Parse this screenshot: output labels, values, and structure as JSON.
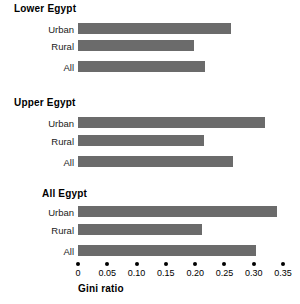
{
  "chart_data": {
    "type": "bar",
    "orientation": "horizontal",
    "title": "",
    "xlabel": "Gini ratio",
    "ylabel": "",
    "xlim": [
      0,
      0.35
    ],
    "grid": false,
    "legend": "none",
    "bar_color": "#6b6b6b",
    "categories": [
      "Urban",
      "Rural",
      "All"
    ],
    "xticks": [
      0,
      0.05,
      0.1,
      0.15,
      0.2,
      0.25,
      0.3,
      0.35
    ],
    "xtick_labels": [
      "0",
      "0.05",
      "0.10",
      "0.15",
      "0.20",
      "0.25",
      "0.30",
      "0.35"
    ],
    "groups": [
      {
        "name": "Lower Egypt",
        "bars": [
          {
            "label": "Urban",
            "value": 0.261
          },
          {
            "label": "Rural",
            "value": 0.198
          },
          {
            "label": "All",
            "value": 0.217
          }
        ]
      },
      {
        "name": "Upper Egypt",
        "bars": [
          {
            "label": "Urban",
            "value": 0.319
          },
          {
            "label": "Rural",
            "value": 0.215
          },
          {
            "label": "All",
            "value": 0.265
          }
        ]
      },
      {
        "name": "All Egypt",
        "bars": [
          {
            "label": "Urban",
            "value": 0.34
          },
          {
            "label": "Rural",
            "value": 0.212
          },
          {
            "label": "All",
            "value": 0.304
          }
        ]
      }
    ]
  }
}
